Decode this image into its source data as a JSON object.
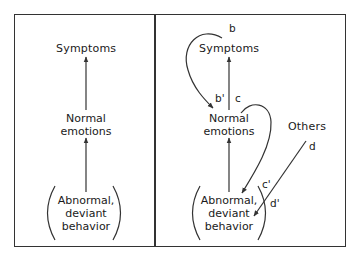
{
  "left_panel": {
    "top_node": "Symptoms",
    "middle_node": [
      "Normal",
      "emotions"
    ],
    "bottom_node": [
      "Abnormal,",
      "deviant",
      "behavior"
    ]
  },
  "right_panel": {
    "top_node": "Symptoms",
    "middle_node": [
      "Normal",
      "emotions"
    ],
    "bottom_node": [
      "Abnormal,",
      "deviant",
      "behavior"
    ],
    "external_node": "Others",
    "edge_labels": {
      "b": "b",
      "b_prime": "b'",
      "c": "c",
      "c_prime": "c'",
      "d": "d",
      "d_prime": "d'"
    }
  },
  "colors": {
    "stroke": "#333333",
    "text": "#1a1a1a",
    "background": "#ffffff"
  }
}
